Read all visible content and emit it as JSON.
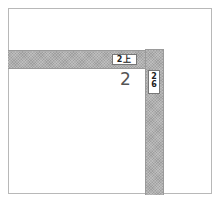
{
  "diagram": {
    "type": "floor-plan-detail",
    "colors": {
      "background": "#ffffff",
      "frame_border": "#b8b8b8",
      "wall_fill": "#b0b0b0",
      "label_text": "#222222",
      "number_text": "#555555"
    },
    "horizontal_wall": {
      "label": "2上"
    },
    "vertical_wall": {
      "label_top": "2",
      "label_bottom": "6"
    },
    "room_number": "2"
  }
}
